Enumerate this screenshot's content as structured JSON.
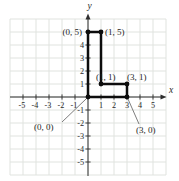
{
  "chart_data": {
    "type": "line",
    "title": "",
    "xlabel": "x",
    "ylabel": "y",
    "xlim": [
      -6,
      6
    ],
    "ylim": [
      -6,
      6
    ],
    "grid": true,
    "legend": false,
    "x_ticks": [
      -5,
      -4,
      -3,
      -2,
      -1,
      1,
      2,
      3,
      4,
      5
    ],
    "y_ticks": [
      4,
      3,
      2,
      1,
      -1,
      -2,
      -3,
      -4,
      -5
    ],
    "y_ticks_unlabeled": [
      5
    ],
    "series": [
      {
        "name": "plotted-polygon",
        "closed": true,
        "points": [
          [
            0,
            0
          ],
          [
            0,
            5
          ],
          [
            1,
            5
          ],
          [
            1,
            1
          ],
          [
            3,
            1
          ],
          [
            3,
            0
          ]
        ]
      }
    ],
    "annotations": [
      {
        "text": "(0, 5)",
        "x": 0,
        "y": 5,
        "placement": "left"
      },
      {
        "text": "(1, 5)",
        "x": 1,
        "y": 5,
        "placement": "right"
      },
      {
        "text": "(1, 1)",
        "x": 1,
        "y": 1,
        "placement": "above"
      },
      {
        "text": "(3, 1)",
        "x": 3,
        "y": 1,
        "placement": "above-right"
      },
      {
        "text": "(0, 0)",
        "x": 0,
        "y": 0,
        "placement": "callout-below-left"
      },
      {
        "text": "(3, 0)",
        "x": 3,
        "y": 0,
        "placement": "callout-below-right"
      }
    ]
  },
  "colors": {
    "background": "#ffffff",
    "grid": "#e0e3df",
    "axis": "#2e2e2e",
    "shape": "#0d0d0d",
    "label_text": "#1f1f1f",
    "tick_text": "#2a2a2a",
    "leader": "#6e6e6e"
  }
}
